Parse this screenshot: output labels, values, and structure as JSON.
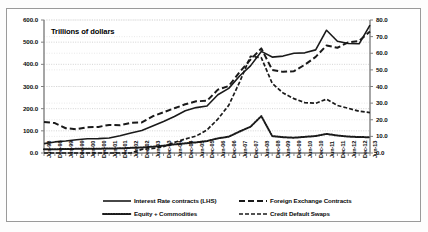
{
  "chart_data": {
    "type": "line",
    "title": "",
    "inner_annotation": "Trillions of dollars",
    "xlabel": "",
    "ylabel_left": "",
    "ylabel_right": "",
    "ylim_left": [
      0.0,
      600.0
    ],
    "ylim_right": [
      0.0,
      80.0
    ],
    "yticks_left": [
      "0.0",
      "100.0",
      "200.0",
      "300.0",
      "400.0",
      "500.0",
      "600.0"
    ],
    "yticks_right": [
      "0.0",
      "10.0",
      "20.0",
      "30.0",
      "40.0",
      "50.0",
      "60.0",
      "70.0",
      "80.0"
    ],
    "grid": true,
    "legend_position": "bottom",
    "categories": [
      "Jun-98",
      "Dec-98",
      "Jun-99",
      "Dec-99",
      "Jun-00",
      "Dec-00",
      "Jun-01",
      "Dec-01",
      "Jun-02",
      "Dec-02",
      "Jun-03",
      "Dec-03",
      "Jun-04",
      "Dec-04",
      "Jun-05",
      "Dec-05",
      "Jun-06",
      "Dec-06",
      "Jun-07",
      "Dec-07",
      "Jun-08",
      "Dec-08",
      "Jun-09",
      "Dec-09",
      "Jun-10",
      "Dec-10",
      "Jun-11",
      "Dec-11",
      "Jun-12",
      "Dec-12",
      "Jun-13"
    ],
    "series": [
      {
        "name": "Interest Rate contracts (LHS)",
        "axis": "left",
        "style": "solid",
        "values": [
          42.4,
          50.0,
          54.1,
          60.1,
          64.1,
          64.7,
          67.5,
          77.5,
          89.9,
          101.7,
          121.8,
          141.9,
          164.6,
          190.5,
          204.8,
          211.9,
          262.5,
          291.6,
          347.3,
          393.1,
          458.3,
          432.7,
          437.2,
          449.9,
          451.8,
          465.3,
          553.9,
          504.1,
          494.0,
          492.6,
          577.3
        ]
      },
      {
        "name": "Foreign Exchange Contracts",
        "axis": "right",
        "style": "dashed",
        "values": [
          18.7,
          18.0,
          14.9,
          14.3,
          15.5,
          15.7,
          16.9,
          16.7,
          18.1,
          18.4,
          22.1,
          24.5,
          26.9,
          29.3,
          31.1,
          31.4,
          38.1,
          40.3,
          48.6,
          56.2,
          62.9,
          50.0,
          48.8,
          49.2,
          53.1,
          57.8,
          64.7,
          63.3,
          66.6,
          67.4,
          73.1
        ]
      },
      {
        "name": "Equity + Commodities",
        "axis": "right",
        "style": "dotted",
        "values": [
          2.3,
          2.3,
          2.4,
          2.5,
          2.5,
          2.6,
          2.7,
          2.8,
          3.1,
          3.3,
          3.8,
          4.4,
          5.2,
          5.8,
          6.4,
          7.2,
          8.8,
          9.8,
          12.9,
          15.8,
          22.2,
          10.2,
          9.5,
          9.2,
          9.7,
          10.2,
          11.5,
          10.5,
          9.9,
          9.6,
          9.5
        ]
      },
      {
        "name": "Credit Default Swaps",
        "axis": "right",
        "style": "dashdot",
        "values": [
          0.0,
          0.0,
          0.0,
          0.0,
          0.0,
          0.0,
          0.0,
          0.0,
          0.0,
          2.2,
          2.7,
          3.8,
          6.4,
          8.4,
          10.2,
          13.9,
          20.4,
          28.7,
          42.6,
          58.2,
          57.3,
          41.9,
          36.1,
          32.7,
          30.3,
          29.9,
          32.4,
          28.6,
          26.9,
          25.1,
          24.3
        ]
      }
    ],
    "legend": [
      {
        "label": "Interest Rate contracts (LHS)",
        "style": "solid"
      },
      {
        "label": "Foreign Exchange Contracts",
        "style": "dashed"
      },
      {
        "label": "Equity + Commodities",
        "style": "dotted"
      },
      {
        "label": "Credit Default Swaps",
        "style": "dashdot"
      }
    ],
    "colors": {
      "line": "#1a1a1a",
      "grid": "#c9c9c9",
      "axis": "#808080",
      "text": "#0b0b0b",
      "frame": "#9a9a9a",
      "background": "#ffffff"
    }
  }
}
